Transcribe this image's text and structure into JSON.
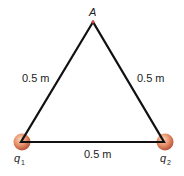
{
  "diagram": {
    "vertex_label": "A",
    "sides": {
      "left": "0.5 m",
      "right": "0.5 m",
      "bottom": "0.5 m"
    },
    "charges": [
      {
        "symbol": "q",
        "subscript": "1"
      },
      {
        "symbol": "q",
        "subscript": "2"
      }
    ],
    "colors": {
      "line": "#111111",
      "charge_fill": "#e8906a",
      "charge_edge": "#b5553a",
      "apex_dot": "#d04a3a"
    }
  }
}
